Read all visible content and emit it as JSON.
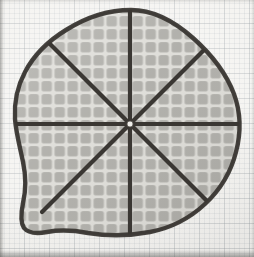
{
  "figure": {
    "medium": "pencil drawing on graph paper",
    "background": {
      "name": "graph-paper",
      "paper_color": "#f4f3f0",
      "minor_grid_color": "#a5acb2",
      "major_grid_color": "#969ba0",
      "minor_grid_spacing_px": 5,
      "major_grid_spacing_px": 25
    },
    "shape": {
      "name": "irregular-blob",
      "outline_color": "#3a3733",
      "outline_width_px": 4,
      "fill_color": "#b9b8b3",
      "texture": "quilted-waffle-grid",
      "texture_cell_px": 13,
      "texture_seam_color": "#dcdbd6",
      "bounds": {
        "left": 14,
        "top": 10,
        "right": 240,
        "bottom": 236
      },
      "center": {
        "x": 130,
        "y": 124
      }
    },
    "divisions": {
      "name": "radial-sector-lines",
      "count": 8,
      "line_color": "#3a3733",
      "line_width_px": 4,
      "angles_deg": [
        0,
        45,
        90,
        135,
        180,
        225,
        270,
        315
      ],
      "description": "Eight equal pie sectors drawn from a single center point to the blob outline"
    },
    "center_dot": {
      "name": "center-point",
      "color": "#efeeea",
      "radius_px": 3
    }
  }
}
